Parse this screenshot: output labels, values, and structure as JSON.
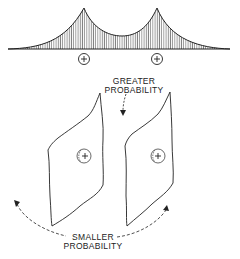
{
  "diagram": {
    "top_curve": {
      "description": "probability density with two cusped peaks",
      "peaks": 2,
      "ion_markers": [
        "+",
        "+"
      ]
    },
    "labels": {
      "greater_line1": "GREATER",
      "greater_line2": "PROBABILITY",
      "smaller_line1": "SMALLER",
      "smaller_line2": "PROBABILITY"
    },
    "lower_panels": {
      "count": 2,
      "ion_markers": [
        "+",
        "+"
      ]
    },
    "colors": {
      "ink": "#222222",
      "background": "#ffffff"
    }
  }
}
